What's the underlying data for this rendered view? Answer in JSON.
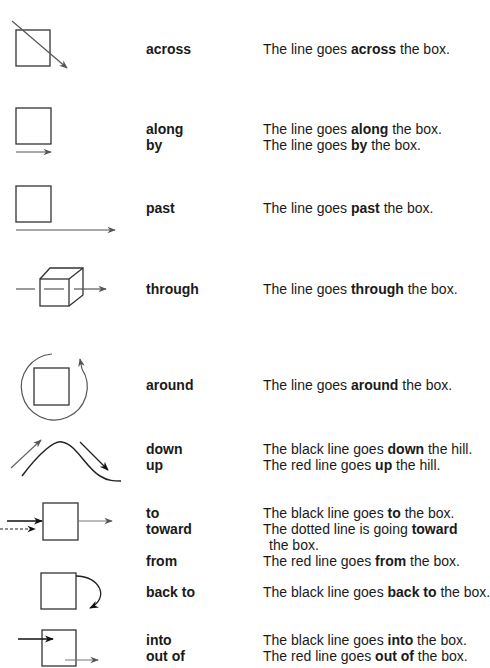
{
  "colors": {
    "black_line": "#222222",
    "red_line": "#7a7a7a",
    "box": "#333333"
  },
  "rows": [
    {
      "id": "across",
      "terms": [
        "across"
      ],
      "sentences": [
        {
          "pre": "The line goes ",
          "bold": "across",
          "post": " the box."
        }
      ]
    },
    {
      "id": "along-by",
      "terms": [
        "along",
        "by"
      ],
      "sentences": [
        {
          "pre": "The line goes ",
          "bold": "along",
          "post": " the box."
        },
        {
          "pre": "The line goes ",
          "bold": "by",
          "post": " the box."
        }
      ]
    },
    {
      "id": "past",
      "terms": [
        "past"
      ],
      "sentences": [
        {
          "pre": "The line goes ",
          "bold": "past",
          "post": " the box."
        }
      ]
    },
    {
      "id": "through",
      "terms": [
        "through"
      ],
      "sentences": [
        {
          "pre": "The line goes ",
          "bold": "through",
          "post": " the box."
        }
      ]
    },
    {
      "id": "around",
      "terms": [
        "around"
      ],
      "sentences": [
        {
          "pre": "The line goes ",
          "bold": "around",
          "post": " the box."
        }
      ]
    },
    {
      "id": "down-up",
      "terms": [
        "down",
        "up"
      ],
      "sentences": [
        {
          "pre": "The black line goes ",
          "bold": "down",
          "post": " the hill."
        },
        {
          "pre": "The red line goes ",
          "bold": "up",
          "post": " the hill."
        }
      ]
    },
    {
      "id": "to-toward-from",
      "terms": [
        "to",
        "toward",
        "",
        "from"
      ],
      "sentences": [
        {
          "pre": "The black line goes ",
          "bold": "to",
          "post": " the box."
        },
        {
          "pre": "The dotted line is going ",
          "bold": "toward",
          "post": ""
        },
        {
          "pre": "the box.",
          "bold": "",
          "post": ""
        },
        {
          "pre": "The red line goes ",
          "bold": "from",
          "post": " the box."
        }
      ]
    },
    {
      "id": "back-to",
      "terms": [
        "back to"
      ],
      "sentences": [
        {
          "pre": "The black line goes ",
          "bold": "back to",
          "post": " the box."
        }
      ]
    },
    {
      "id": "into-out-of",
      "terms": [
        "into",
        "out of"
      ],
      "sentences": [
        {
          "pre": "The black line goes ",
          "bold": "into",
          "post": " the box."
        },
        {
          "pre": "The red line goes ",
          "bold": "out of",
          "post": " the box."
        }
      ]
    }
  ]
}
